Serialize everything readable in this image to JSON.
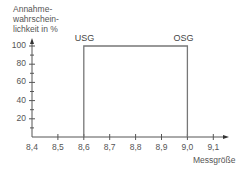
{
  "chart_data": {
    "type": "line",
    "title": "",
    "ylabel_lines": [
      "Annahme-",
      "wahrschein-",
      "lichkeit in %"
    ],
    "xlabel": "Messgröße",
    "x_ticks": [
      "8,4",
      "8,5",
      "8,6",
      "8,7",
      "8,8",
      "8,9",
      "9,0",
      "9,1"
    ],
    "y_ticks": [
      "20",
      "40",
      "60",
      "80",
      "100"
    ],
    "xlim": [
      8.4,
      9.15
    ],
    "ylim": [
      0,
      105
    ],
    "grid": false,
    "series": [
      {
        "name": "Annahmewahrscheinlichkeit",
        "x": [
          8.6,
          8.6,
          9.0,
          9.0
        ],
        "y": [
          0,
          100,
          100,
          0
        ]
      }
    ],
    "annotations": [
      {
        "text": "USG",
        "x": 8.6,
        "y": 100
      },
      {
        "text": "OSG",
        "x": 9.0,
        "y": 100
      }
    ],
    "line_color": "#777777",
    "axis_color": "#555555"
  }
}
